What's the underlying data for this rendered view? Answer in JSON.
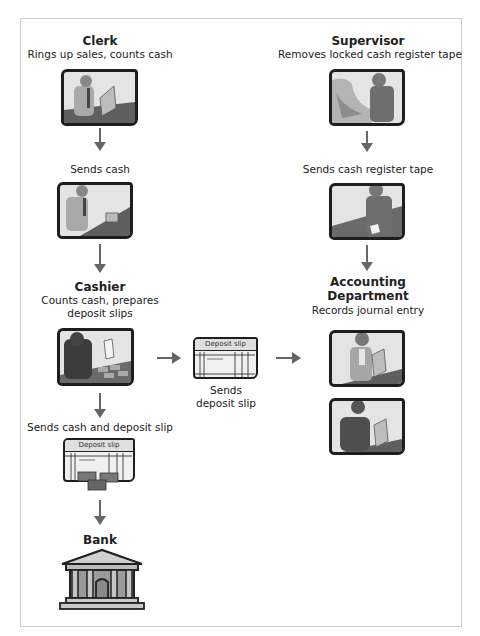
{
  "diagram": {
    "type": "flowchart",
    "topic": "Cash register receipts control",
    "left_column": {
      "clerk": {
        "title": "Clerk",
        "description": "Rings up sales, counts cash",
        "icon": "clerk-at-register-icon"
      },
      "sends_cash": {
        "label": "Sends cash",
        "icon": "clerk-handing-cash-icon"
      },
      "cashier": {
        "title": "Cashier",
        "description_line1": "Counts cash, prepares",
        "description_line2": "deposit slips",
        "icon": "cashier-counting-cash-icon"
      },
      "sends_cash_and_slip": {
        "label": "Sends cash and deposit slip",
        "slip_title": "Deposit slip",
        "icon": "deposit-slip-with-cash-icon"
      },
      "bank": {
        "title": "Bank",
        "icon": "bank-building-icon"
      }
    },
    "middle": {
      "slip_title": "Deposit slip",
      "label_line1": "Sends",
      "label_line2": "deposit slip",
      "icon": "deposit-slip-icon"
    },
    "right_column": {
      "supervisor": {
        "title": "Supervisor",
        "description": "Removes locked cash register tape",
        "icon": "supervisor-at-register-icon"
      },
      "sends_tape": {
        "label": "Sends cash register tape",
        "icon": "supervisor-holding-tape-icon"
      },
      "accounting": {
        "title_line1": "Accounting",
        "title_line2": "Department",
        "description": "Records journal entry",
        "icons": [
          "accountant-female-icon",
          "accountant-male-icon"
        ]
      }
    },
    "colors": {
      "arrow": "#666666",
      "frame_border": "#cfcfcf",
      "picture_border": "#1e1e1e",
      "picture_bg": "#e4e4e4"
    }
  }
}
